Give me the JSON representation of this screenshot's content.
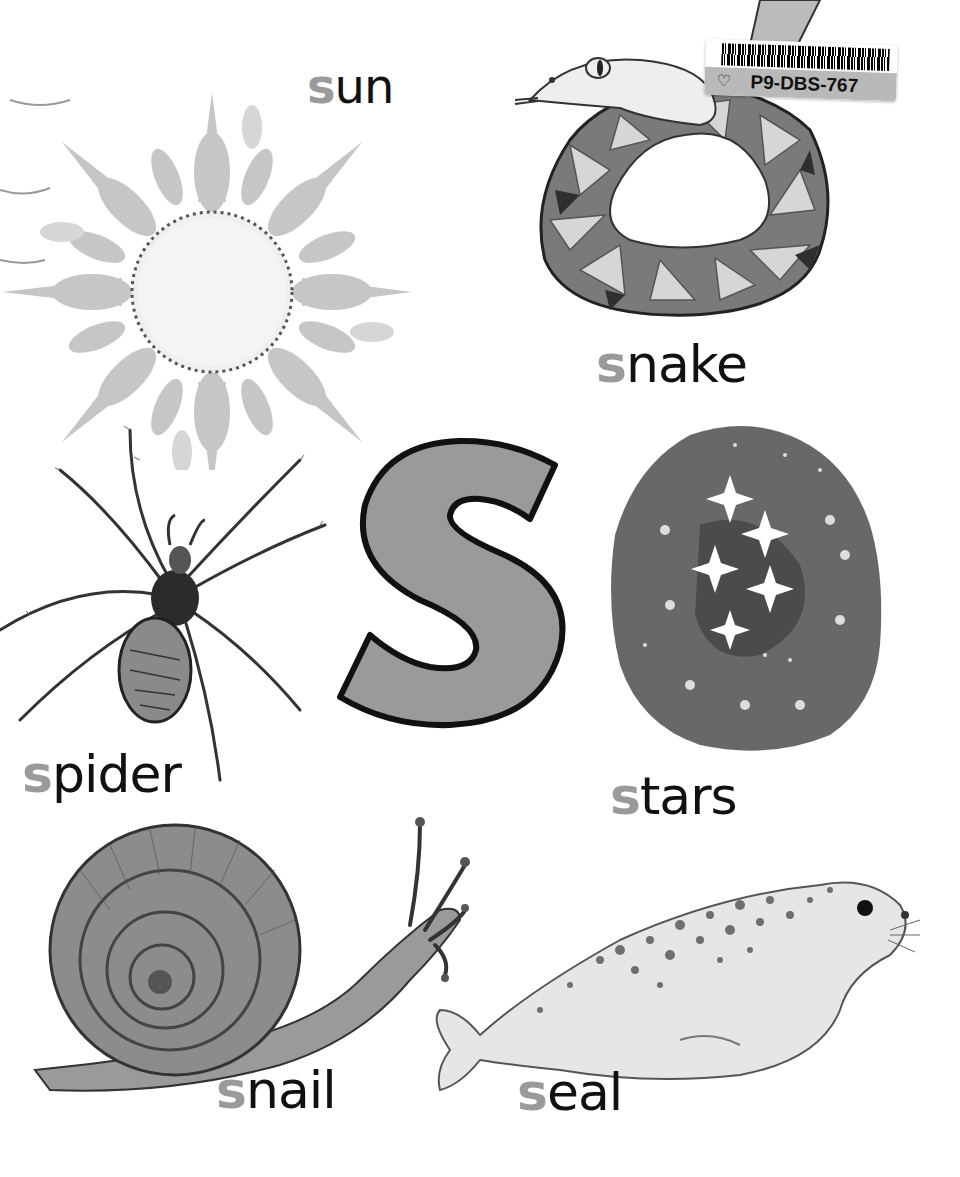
{
  "page": {
    "letter": "S",
    "letter_fill": "#9a9a9a",
    "letter_stroke": "#111111",
    "lead_letter_color": "#9a9a9a",
    "text_color": "#111111"
  },
  "sticker": {
    "code": "P9-DBS-767",
    "icon": "tag-icon"
  },
  "words": [
    {
      "id": "sun",
      "lead": "s",
      "rest": "un"
    },
    {
      "id": "snake",
      "lead": "s",
      "rest": "nake"
    },
    {
      "id": "spider",
      "lead": "s",
      "rest": "pider"
    },
    {
      "id": "stars",
      "lead": "s",
      "rest": "tars"
    },
    {
      "id": "snail",
      "lead": "s",
      "rest": "nail"
    },
    {
      "id": "seal",
      "lead": "s",
      "rest": "eal"
    }
  ]
}
